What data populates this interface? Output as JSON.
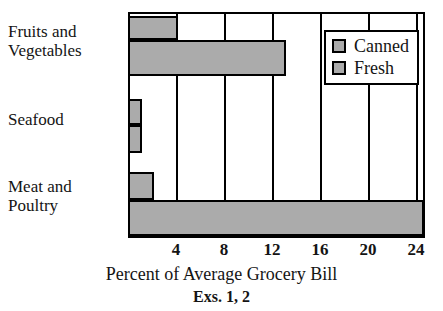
{
  "chart_data": {
    "type": "bar",
    "orientation": "horizontal",
    "title": "",
    "xlabel": "Percent of Average Grocery Bill",
    "ylabel": "",
    "caption": "Exs. 1, 2",
    "categories": [
      "Fruits and\nVegetables",
      "Seafood",
      "Meat and\nPoultry"
    ],
    "series": [
      {
        "name": "Canned",
        "values": [
          4,
          1,
          2
        ]
      },
      {
        "name": "Fresh",
        "values": [
          13,
          1,
          24.5
        ]
      }
    ],
    "xlim": [
      0,
      24.75
    ],
    "xticks": [
      4,
      8,
      12,
      16,
      20,
      24
    ],
    "xtick_labels": [
      "4",
      "8",
      "12",
      "16",
      "20",
      "24"
    ],
    "grid": true,
    "grid_axis": "x",
    "legend_position": "top-right",
    "bar_fill_color": "#ababab",
    "bar_edge_color": "#000000",
    "axis_color": "#000000",
    "background_color": "#ffffff"
  },
  "plot": {
    "left_px": 128,
    "top_px": 12,
    "width_px": 297,
    "height_px": 226,
    "px_per_unit": 12
  },
  "legend": {
    "items": [
      {
        "label": "Canned",
        "swatch_color": "#ababab"
      },
      {
        "label": "Fresh",
        "swatch_color": "#ababab"
      }
    ]
  },
  "bars": [
    {
      "category": "Fruits and Vegetables",
      "series": "Canned",
      "value": 4,
      "top_px": 2,
      "height_px": 24
    },
    {
      "category": "Fruits and Vegetables",
      "series": "Fresh",
      "value": 13,
      "top_px": 26,
      "height_px": 36
    },
    {
      "category": "Seafood",
      "series": "Canned",
      "value": 1,
      "top_px": 85,
      "height_px": 26
    },
    {
      "category": "Seafood",
      "series": "Fresh",
      "value": 1,
      "top_px": 111,
      "height_px": 28
    },
    {
      "category": "Meat and Poultry",
      "series": "Canned",
      "value": 2,
      "top_px": 158,
      "height_px": 28
    },
    {
      "category": "Meat and Poultry",
      "series": "Fresh",
      "value": 24.5,
      "top_px": 186,
      "height_px": 36
    }
  ],
  "title_remnant": "",
  "axis": {
    "xaxis_title": "Percent of Average Grocery Bill",
    "figure_caption": "Exs. 1, 2"
  }
}
